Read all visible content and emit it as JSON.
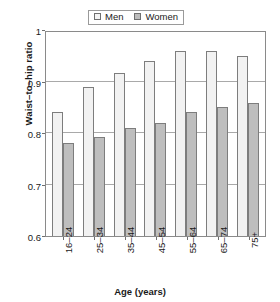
{
  "chart_data": {
    "type": "bar",
    "title": "",
    "subtitle": "",
    "xlabel": "Age (years)",
    "ylabel": "Waist–to–hip ratio",
    "categories": [
      "16–24",
      "25–34",
      "35–44",
      "45–54",
      "55–64",
      "65–74",
      "75+"
    ],
    "series": [
      {
        "name": "Men",
        "color": "#f2f2f2",
        "values": [
          0.84,
          0.89,
          0.917,
          0.94,
          0.96,
          0.96,
          0.95
        ]
      },
      {
        "name": "Women",
        "color": "#bebebe",
        "values": [
          0.78,
          0.793,
          0.81,
          0.82,
          0.84,
          0.85,
          0.858
        ]
      }
    ],
    "ylim": [
      0.6,
      1
    ],
    "yticks": [
      "0.6",
      "0.7",
      "0.8",
      "0.9",
      "1"
    ],
    "ytick_values": [
      0.6,
      0.7,
      0.8,
      0.9,
      1
    ],
    "grid": "horizontal",
    "legend_position": "top-center"
  },
  "legend": {
    "entries": [
      {
        "label": "Men",
        "swatch": "men-swatch-icon"
      },
      {
        "label": "Women",
        "swatch": "women-swatch-icon"
      }
    ]
  },
  "axes": {
    "y_title": "Waist–to–hip ratio",
    "x_title": "Age (years)"
  },
  "colors": {
    "men_fill": "#f2f2f2",
    "women_fill": "#bebebe",
    "bar_border": "#7d7d7d",
    "gridline": "#a9a9a9",
    "axis": "#8a8a8a",
    "text": "#1a1a1a"
  }
}
